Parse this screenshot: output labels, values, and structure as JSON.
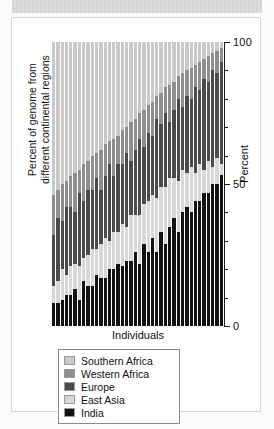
{
  "figure": {
    "background_color": "#ffffff",
    "border_color": "#d8d8d8",
    "banner_color": "#d9d9d9"
  },
  "chart_data": {
    "type": "bar",
    "stacked": true,
    "normalized": true,
    "title": "",
    "xlabel": "Individuals",
    "ylabel": "Percent",
    "ylabel_secondary": "Percent of genome from different continental regions",
    "ylim": [
      0,
      100
    ],
    "yticks": [
      0,
      50,
      100
    ],
    "ytick_labels": [
      "0",
      "50",
      "100"
    ],
    "yminor_step": 10,
    "grid": false,
    "legend_position": "below-axes",
    "axis_side": "right",
    "categories": [
      "1",
      "2",
      "3",
      "4",
      "5",
      "6",
      "7",
      "8",
      "9",
      "10",
      "11",
      "12",
      "13",
      "14",
      "15",
      "16",
      "17",
      "18",
      "19",
      "20",
      "21",
      "22",
      "23",
      "24",
      "25",
      "26",
      "27",
      "28",
      "29",
      "30",
      "31",
      "32",
      "33",
      "34",
      "35",
      "36",
      "37",
      "38",
      "39",
      "40"
    ],
    "series": [
      {
        "name": "Southern Africa",
        "color": "#c9c9c9",
        "values": [
          54,
          52,
          50,
          49,
          47,
          46,
          45,
          43,
          42,
          40,
          39,
          38,
          36,
          35,
          34,
          33,
          31,
          30,
          28,
          27,
          25,
          24,
          22,
          21,
          19,
          18,
          16,
          15,
          14,
          12,
          11,
          10,
          9,
          8,
          7,
          6,
          5,
          4,
          3,
          2
        ]
      },
      {
        "name": "Western Africa",
        "color": "#8e8e8e",
        "values": [
          14,
          10,
          13,
          9,
          11,
          14,
          8,
          13,
          10,
          12,
          9,
          14,
          11,
          8,
          13,
          10,
          12,
          9,
          14,
          11,
          9,
          13,
          10,
          12,
          8,
          11,
          9,
          13,
          10,
          8,
          12,
          9,
          11,
          8,
          10,
          7,
          9,
          6,
          8,
          5
        ]
      },
      {
        "name": "Europe",
        "color": "#4a4a4a",
        "values": [
          18,
          22,
          17,
          24,
          21,
          18,
          26,
          20,
          23,
          21,
          25,
          19,
          22,
          27,
          20,
          24,
          21,
          26,
          19,
          23,
          27,
          20,
          24,
          21,
          28,
          22,
          26,
          20,
          24,
          29,
          22,
          27,
          24,
          30,
          26,
          32,
          28,
          34,
          30,
          36
        ]
      },
      {
        "name": "East Asia",
        "color": "#d8d8d8",
        "values": [
          6,
          8,
          11,
          7,
          10,
          9,
          12,
          8,
          11,
          13,
          9,
          12,
          14,
          10,
          13,
          11,
          15,
          12,
          16,
          13,
          17,
          14,
          18,
          15,
          19,
          16,
          20,
          17,
          14,
          18,
          15,
          12,
          16,
          10,
          13,
          8,
          11,
          6,
          9,
          4
        ]
      },
      {
        "name": "India",
        "color": "#121212",
        "values": [
          8,
          8,
          9,
          11,
          11,
          13,
          9,
          16,
          14,
          14,
          18,
          17,
          17,
          20,
          20,
          22,
          21,
          23,
          23,
          26,
          22,
          29,
          26,
          31,
          26,
          33,
          29,
          35,
          38,
          33,
          40,
          42,
          40,
          44,
          44,
          47,
          47,
          50,
          50,
          53
        ]
      }
    ]
  },
  "legend": {
    "items": [
      {
        "label": "Southern Africa",
        "color": "#c9c9c9"
      },
      {
        "label": "Western Africa",
        "color": "#8e8e8e"
      },
      {
        "label": "Europe",
        "color": "#4a4a4a"
      },
      {
        "label": "East Asia",
        "color": "#d8d8d8"
      },
      {
        "label": "India",
        "color": "#121212"
      }
    ]
  },
  "axes": {
    "y_title": "Percent",
    "y_side_label_line1": "Percent of genome from",
    "y_side_label_line2": "different continental regions",
    "x_title": "Individuals"
  }
}
